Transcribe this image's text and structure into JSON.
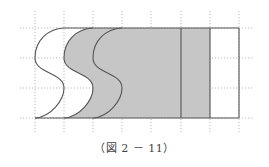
{
  "caption": "（図 2 － 11）",
  "colors": {
    "background": "#ffffff",
    "shade": "#c6c6c6",
    "outline": "#555555",
    "grid": "#aaaaaa"
  },
  "grid": {
    "columns_x": [
      35,
      64,
      93,
      122,
      151,
      181,
      210,
      239
    ],
    "rows_y": [
      28,
      58,
      88,
      118
    ],
    "h_extent": [
      20,
      254
    ],
    "v_extent": [
      11,
      134
    ]
  },
  "figure": {
    "top_y": 28,
    "bottom_y": 118,
    "right_x": 239,
    "s_curves": [
      {
        "name": "curve-1",
        "offset_x": 0
      },
      {
        "name": "curve-2",
        "offset_x": 29
      },
      {
        "name": "curve-3",
        "offset_x": 58
      }
    ],
    "vertical_lines_x": [
      181,
      210
    ],
    "shaded_region": "between curve-2 and x=210",
    "unshaded_regions": [
      "between curve-1 and curve-2",
      "between x=210 and x=239"
    ]
  }
}
